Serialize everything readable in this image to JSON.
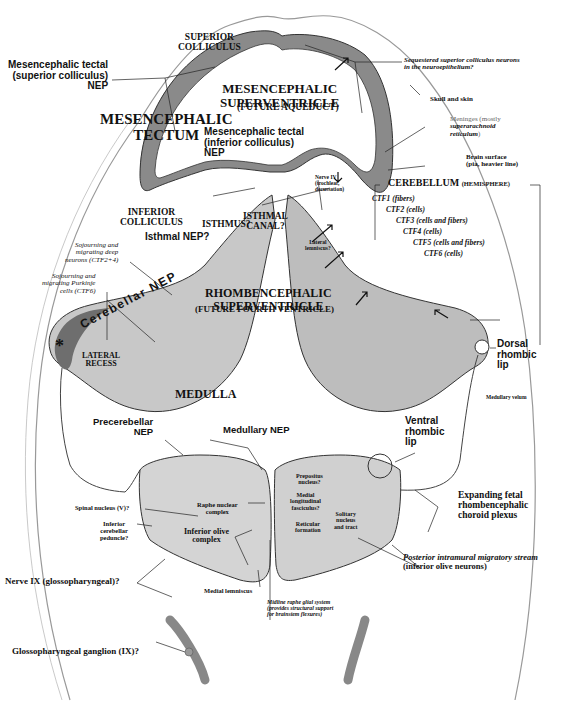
{
  "figure": {
    "regions": {
      "superior_colliculus": "SUPERIOR\nCOLLICULUS",
      "mesencephalic_tectum": "MESENCEPHALIC\nTECTUM",
      "mesencephalic_superventricle": "MESENCEPHALIC\nSUPERVENTRICLE",
      "future_aqueduct": "(FUTURE AQUEDUCT)",
      "inferior_colliculus": "INFERIOR\nCOLLICULUS",
      "isthmus": "ISTHMUS?",
      "isthmal_canal": "ISTHMAL\nCANAL?",
      "cerebellum": "CEREBELLUM",
      "cerebellum_sub": "(HEMISPHERE)",
      "rhombencephalic_superventricle": "RHOMBENCEPHALIC\nSUPERVENTRICLE",
      "future_fourth_ventricle": "(FUTURE FOURTH VENTRICLE)",
      "lateral_recess": "LATERAL\nRECESS",
      "medulla": "MEDULLA",
      "cerebellar_nep": "Cerebellar NEP",
      "asterisk": "*"
    },
    "labels_left": {
      "tectal_sc_nep": "Mesencephalic tectal\n(superior colliculus)\nNEP",
      "tectal_ic_nep": "Mesencephalic tectal\n(inferior colliculus)\nNEP",
      "isthmal_nep": "Isthmal NEP?",
      "sojourning_deep": "Sojourning and\nmigrating deep\nneurons (CTF2+4)",
      "sojourning_purkinje": "Sojourning and\nmigrating Purkinje\ncells (CTF6)",
      "precerebellar_nep": "Precerebellar\nNEP",
      "medullary_nep": "Medullary NEP",
      "spinal_nucleus": "Spinal nucleus (V)?",
      "inferior_cerebellar_peduncle": "Inferior\ncerebellar\npeduncle?",
      "raphe_nuclear_complex": "Raphe nuclear\ncomplex",
      "inferior_olive_complex": "Inferior olive\ncomplex",
      "nerve_ix": "Nerve IX (glossopharyngeal)?",
      "medial_lemniscus": "Medial lemniscus",
      "glossopharyngeal_ganglion": "Glossopharyngeal ganglion (IX)?"
    },
    "labels_right": {
      "sequestered": "Sequestered superior colliculus neurons\nin the neuroepithelium?",
      "skull_skin": "Skull and skin",
      "meninges_a": "Meninges (mostly",
      "meninges_b": "superarachnoid\nreticulum",
      "meninges_c": ")",
      "brain_surface": "Brain surface\n(pia, heavier line)",
      "nerve_iv": "Nerve IV\n(trochlear,\ndecussation)",
      "lateral_lemniscus": "Lateral\nlemniscus?",
      "ctf1": "CTF1 (fibers)",
      "ctf2": "CTF2 (cells)",
      "ctf3": "CTF3 (cells and fibers)",
      "ctf4": "CTF4 (cells)",
      "ctf5": "CTF5 (cells and fibers)",
      "ctf6": "CTF6 (cells)",
      "dorsal_rhombic_lip": "Dorsal\nrhombic\nlip",
      "medullary_velum": "Medullary velum",
      "ventral_rhombic_lip": "Ventral\nrhombic\nlip",
      "prepositus": "Prepositus\nnucleus?",
      "mlf": "Medial\nlongitudinal\nfasciculus?",
      "solitary": "Solitary\nnucleus\nand tract",
      "reticular": "Reticular\nformation",
      "choroid_plexus": "Expanding fetal\nrhombencephalic\nchoroid plexus",
      "pims_a": "Posterior intramural migratory stream",
      "pims_b": "(inferior olive neurons)",
      "midline_raphe": "Midline raphe glial system\n(provides structural support\nfor brainstem flexures)"
    },
    "colors": {
      "neuroepithelium": "#7a7a7a",
      "parenchyma": "#c9c9c9",
      "light_tissue": "#e4e4e4",
      "outline": "#333333",
      "leader": "#222222",
      "background": "#ffffff"
    }
  }
}
